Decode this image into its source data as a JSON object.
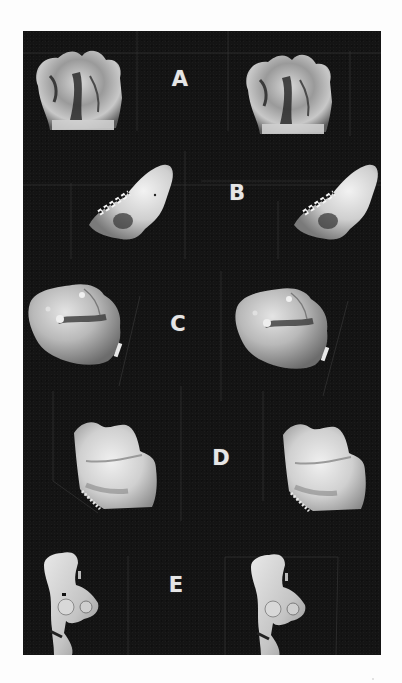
{
  "plate": {
    "background_color": "#141414",
    "page_color": "#fdfdfd",
    "label_color": "#e6e6e6",
    "rows": [
      {
        "label": "A",
        "label_pos": {
          "x": 157,
          "y": 48
        },
        "specimen": "fossil-tooth-crown-occlusal",
        "left": {
          "cx": 62,
          "cy": 62
        },
        "right": {
          "cx": 272,
          "cy": 66
        }
      },
      {
        "label": "B",
        "label_pos": {
          "x": 214,
          "y": 162
        },
        "specimen": "fossil-tooth-oblique",
        "left": {
          "cx": 97,
          "cy": 171
        },
        "right": {
          "cx": 302,
          "cy": 171
        }
      },
      {
        "label": "C",
        "label_pos": {
          "x": 155,
          "y": 293
        },
        "specimen": "fossil-molar-side",
        "left": {
          "cx": 48,
          "cy": 282
        },
        "right": {
          "cx": 254,
          "cy": 286
        }
      },
      {
        "label": "D",
        "label_pos": {
          "x": 198,
          "y": 427
        },
        "specimen": "fossil-molar-lingual",
        "left": {
          "cx": 94,
          "cy": 418
        },
        "right": {
          "cx": 303,
          "cy": 420
        }
      },
      {
        "label": "E",
        "label_pos": {
          "x": 153,
          "y": 554
        },
        "specimen": "fossil-tooth-root-lateral",
        "left": {
          "cx": 38,
          "cy": 541
        },
        "right": {
          "cx": 245,
          "cy": 543
        }
      }
    ]
  }
}
